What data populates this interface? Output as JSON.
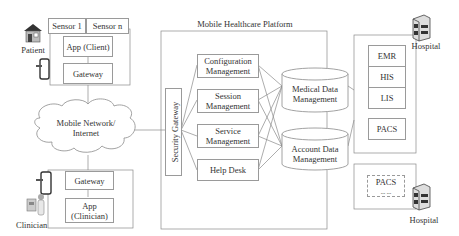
{
  "platform": {
    "title": "Mobile Healthcare Platform",
    "security_gateway": "Security Gateway",
    "modules": [
      {
        "label_line1": "Configuration",
        "label_line2": "Management"
      },
      {
        "label_line1": "Session",
        "label_line2": "Management"
      },
      {
        "label_line1": "Service",
        "label_line2": "Management"
      },
      {
        "label_line1": "Help Desk",
        "label_line2": ""
      }
    ],
    "databases": [
      {
        "label_line1": "Medical Data",
        "label_line2": "Management"
      },
      {
        "label_line1": "Account Data",
        "label_line2": "Management"
      }
    ]
  },
  "patient": {
    "label": "Patient",
    "sensors": [
      "Sensor 1",
      "Sensor n"
    ],
    "app": "App (Client)",
    "gateway": "Gateway"
  },
  "network": {
    "line1": "Mobile Network/",
    "line2": "Internet"
  },
  "clinician": {
    "label": "Clinician",
    "gateway": "Gateway",
    "app_line1": "App",
    "app_line2": "(Clinician)"
  },
  "hospital1": {
    "label": "Hospital",
    "systems": [
      "EMR",
      "HIS",
      "LIS"
    ],
    "pacs": "PACS"
  },
  "hospital2": {
    "label": "Hospital",
    "pacs": "PACS",
    "ellipsis": "... ..."
  }
}
